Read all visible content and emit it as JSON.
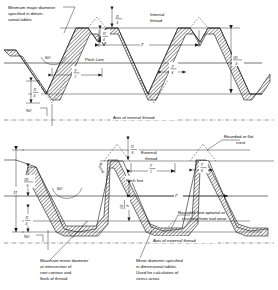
{
  "figure": {
    "type": "engineering-diagram"
  },
  "upper": {
    "name": "internal-thread-diagram",
    "thread_label_line1": "Internal",
    "thread_label_line2": "thread",
    "callout_major_dia_line1": "Minimum major diameter",
    "callout_major_dia_line2": "specified in dimen-",
    "callout_major_dia_line3": "sional tables",
    "pitch_line_label": "Pitch Line",
    "axis_label": "Axis of internal thread",
    "angle_flank": "60°",
    "angle_axis": "90°",
    "dim_pitch": "P",
    "dim_half_pitch_num": "P",
    "dim_half_pitch_den": "2",
    "dim_quarter_pitch_num": "P",
    "dim_quarter_pitch_den": "4",
    "dim_crest_num": "H",
    "dim_crest_den": "8",
    "dim_root_num": "H",
    "dim_root_den": "4",
    "dim_height_num": "5H",
    "dim_height_den": "8"
  },
  "lower": {
    "name": "external-thread-diagram",
    "thread_label_line1": "External",
    "thread_label_line2": "thread",
    "pitch_line_label": "Pitch line",
    "axis_label": "Axis of external thread",
    "angle_flank": "60°",
    "angle_axis": "90°",
    "crest_note_line1": "Rounded or flat",
    "crest_note_line2": "crest",
    "root_note_line1": "Rounded root optional or",
    "root_note_line2": "resulting from tool wear",
    "minor_dia_note_line1": "Maximum minor diameter",
    "minor_dia_note_line2": "at intersection of",
    "minor_dia_note_line3": "root contour and",
    "minor_dia_note_line4": "flank of thread",
    "minor_dia_spec_line1": "Minor diameter specified",
    "minor_dia_spec_line2": "in dimensional tables.",
    "minor_dia_spec_line3": "Used for calculation of",
    "minor_dia_spec_line4": "stress areas",
    "dim_pitch": "P",
    "dim_half_pitch_num": "P",
    "dim_half_pitch_den": "2",
    "dim_eighth_pitch_num": "P",
    "dim_eighth_pitch_den": "8",
    "dim_total_height": "H",
    "dim_crest_num": "H",
    "dim_crest_den": "8",
    "dim_upper_num": "3H",
    "dim_upper_den": "8",
    "dim_lower_num": "H",
    "dim_lower_den": "4",
    "dim_root_num": "H",
    "dim_root_den": "4",
    "dim_mid_num": "5H",
    "dim_mid_den": "8",
    "grind_note": "Grind"
  },
  "colors": {
    "ink": "#1a1a1a",
    "background": "#ffffff"
  }
}
